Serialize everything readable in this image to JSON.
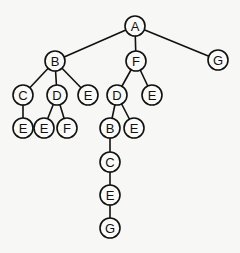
{
  "diagram": {
    "type": "tree",
    "node_radius": 10,
    "nodes": [
      {
        "id": "n1",
        "label": "A",
        "x": 135,
        "y": 26
      },
      {
        "id": "n2",
        "label": "B",
        "x": 55,
        "y": 61
      },
      {
        "id": "n3",
        "label": "F",
        "x": 136,
        "y": 61
      },
      {
        "id": "n4",
        "label": "G",
        "x": 218,
        "y": 60
      },
      {
        "id": "n5",
        "label": "C",
        "x": 23,
        "y": 95
      },
      {
        "id": "n6",
        "label": "D",
        "x": 57,
        "y": 95
      },
      {
        "id": "n7",
        "label": "E",
        "x": 88,
        "y": 95
      },
      {
        "id": "n8",
        "label": "D",
        "x": 117,
        "y": 95
      },
      {
        "id": "n9",
        "label": "E",
        "x": 152,
        "y": 95
      },
      {
        "id": "n10",
        "label": "E",
        "x": 23,
        "y": 128
      },
      {
        "id": "n11",
        "label": "E",
        "x": 44,
        "y": 128
      },
      {
        "id": "n12",
        "label": "F",
        "x": 67,
        "y": 128
      },
      {
        "id": "n13",
        "label": "B",
        "x": 110,
        "y": 128
      },
      {
        "id": "n14",
        "label": "E",
        "x": 134,
        "y": 128
      },
      {
        "id": "n15",
        "label": "C",
        "x": 110,
        "y": 162
      },
      {
        "id": "n16",
        "label": "E",
        "x": 110,
        "y": 195
      },
      {
        "id": "n17",
        "label": "G",
        "x": 110,
        "y": 228
      }
    ],
    "edges": [
      [
        "n1",
        "n2"
      ],
      [
        "n1",
        "n3"
      ],
      [
        "n1",
        "n4"
      ],
      [
        "n2",
        "n5"
      ],
      [
        "n2",
        "n6"
      ],
      [
        "n2",
        "n7"
      ],
      [
        "n3",
        "n8"
      ],
      [
        "n3",
        "n9"
      ],
      [
        "n5",
        "n10"
      ],
      [
        "n6",
        "n11"
      ],
      [
        "n6",
        "n12"
      ],
      [
        "n8",
        "n13"
      ],
      [
        "n8",
        "n14"
      ],
      [
        "n13",
        "n15"
      ],
      [
        "n15",
        "n16"
      ],
      [
        "n16",
        "n17"
      ]
    ]
  }
}
